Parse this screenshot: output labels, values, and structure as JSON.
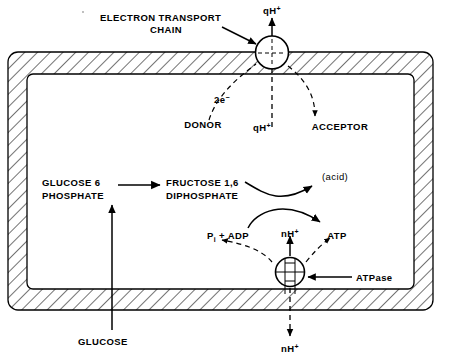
{
  "figure": {
    "type": "biochemical-pathway-diagram",
    "colors": {
      "ink": "#000000",
      "background": "#ffffff",
      "hatch": "#000000"
    }
  },
  "labels": {
    "electron_transport_chain_line1": "ELECTRON  TRANSPORT",
    "electron_transport_chain_line2": "CHAIN",
    "proton_out_top": "qH",
    "proton_out_top_charge": "+",
    "proton_in_top": "qH",
    "proton_in_top_charge": "+",
    "two_electrons": "2e",
    "two_electrons_charge": "−",
    "donor": "DONOR",
    "acceptor": "ACCEPTOR",
    "glucose_6_phosphate_line1": "GLUCOSE 6",
    "glucose_6_phosphate_line2": "PHOSPHATE",
    "fructose_diphosphate_line1": "FRUCTOSE 1,6",
    "fructose_diphosphate_line2": "DIPHOSPHATE",
    "acid": "(acid)",
    "pi_adp_p": "P",
    "pi_adp_subscript": "i",
    "pi_adp_rest": " + ADP",
    "proton_in_bottom": "nH",
    "proton_in_bottom_charge": "+",
    "atp": "ATP",
    "atpase": "ATPase",
    "glucose": "GLUCOSE",
    "proton_out_bottom": "nH",
    "proton_out_bottom_charge": "+"
  },
  "components": {
    "membrane": {
      "name": "membrane",
      "style": "hatched-rounded-rectangle"
    },
    "etc_complex": {
      "name": "electron-transport-chain-complex",
      "shape": "circle-with-cross"
    },
    "atpase_complex": {
      "name": "atpase-complex",
      "shape": "circle-with-channel"
    }
  },
  "arrows": [
    {
      "name": "qh-out-top",
      "style": "solid",
      "direction": "up"
    },
    {
      "name": "qh-in-top",
      "style": "dashed",
      "direction": "down"
    },
    {
      "name": "two-electrons-donor",
      "style": "dashed",
      "direction": "up"
    },
    {
      "name": "electrons-to-acceptor",
      "style": "dashed",
      "direction": "down"
    },
    {
      "name": "g6p-to-fdp",
      "style": "solid",
      "direction": "right"
    },
    {
      "name": "fdp-to-acid",
      "style": "solid",
      "direction": "up-right"
    },
    {
      "name": "pi-adp-to-atp",
      "style": "solid",
      "direction": "up-right"
    },
    {
      "name": "atp-to-pi-adp",
      "style": "dashed",
      "direction": "up-left"
    },
    {
      "name": "nh-in-bottom",
      "style": "solid",
      "direction": "up"
    },
    {
      "name": "nh-out-bottom",
      "style": "dashed",
      "direction": "down"
    },
    {
      "name": "glucose-uptake",
      "style": "solid",
      "direction": "up"
    },
    {
      "name": "etc-pointer",
      "style": "solid",
      "direction": "right"
    },
    {
      "name": "atpase-pointer",
      "style": "solid",
      "direction": "left"
    }
  ]
}
